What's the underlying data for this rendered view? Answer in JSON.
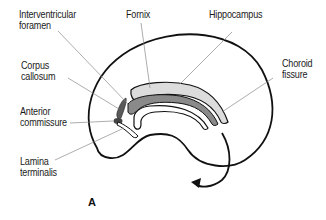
{
  "diagram": {
    "panel_label": "A",
    "labels": {
      "interventricular_foramen": [
        "Interventricular",
        "foramen"
      ],
      "fornix": [
        "Fornix"
      ],
      "hippocampus": [
        "Hippocampus"
      ],
      "corpus_callosum": [
        "Corpus",
        "callosum"
      ],
      "choroid_fissure": [
        "Choroid",
        "fissure"
      ],
      "anterior_commissure": [
        "Anterior",
        "commissure"
      ],
      "lamina_terminalis": [
        "Lamina",
        "terminalis"
      ]
    },
    "colors": {
      "outline": "#111111",
      "leader_line": "#8a8a8a",
      "hippocampus_fill": "#dcdcdc",
      "fornix_fill": "#8a8a8a",
      "commissure_fill": "#555555"
    }
  }
}
